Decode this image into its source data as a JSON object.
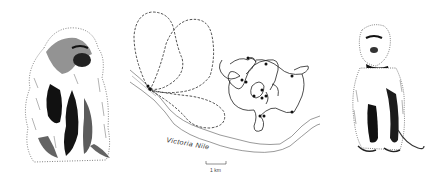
{
  "figure": {
    "left_illustration": "baboon-sitting",
    "right_illustration": "monkey-standing",
    "map": {
      "river_label": "Victoria Nile",
      "scale_label": "1 km",
      "legend": {
        "dashed_path": "baboon-ranging-routes",
        "solid_path": "monkey-ranging-routes"
      }
    },
    "colors": {
      "ink": "#1a1a1a",
      "river": "#555555",
      "background": "#ffffff"
    }
  }
}
